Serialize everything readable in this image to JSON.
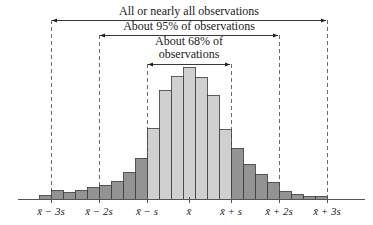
{
  "chart_data": {
    "type": "bar",
    "title": "",
    "xlabel": "",
    "ylabel": "",
    "bars": {
      "count": 24,
      "x_start": 39,
      "bar_width": 12,
      "baseline_y": 199,
      "tops_y": [
        195,
        190,
        192,
        190,
        187,
        185,
        181,
        172,
        158,
        128,
        90,
        76,
        67,
        77,
        95,
        129,
        148,
        164,
        174,
        182,
        191,
        194,
        196,
        196
      ],
      "shade": [
        "dark",
        "dark",
        "dark",
        "dark",
        "dark",
        "dark",
        "dark",
        "dark",
        "dark",
        "light",
        "light",
        "light",
        "light",
        "light",
        "light",
        "light",
        "dark",
        "dark",
        "dark",
        "dark",
        "dark",
        "dark",
        "dark",
        "dark"
      ]
    },
    "relative_heights": [
      4,
      9,
      7,
      9,
      12,
      14,
      18,
      27,
      41,
      71,
      109,
      123,
      132,
      122,
      104,
      70,
      51,
      35,
      25,
      17,
      8,
      5,
      3,
      3
    ],
    "ticks": [
      {
        "label": "x̄ − 3s",
        "x": 51
      },
      {
        "label": "x̄ − 2s",
        "x": 99
      },
      {
        "label": "x̄ − s",
        "x": 147
      },
      {
        "label": "x̄",
        "x": 189
      },
      {
        "label": "x̄ + s",
        "x": 231
      },
      {
        "label": "x̄ + 2s",
        "x": 279
      },
      {
        "label": "x̄ + 3s",
        "x": 327
      }
    ],
    "annotations": [
      {
        "lines": [
          "All or nearly all observations"
        ],
        "from_x": 51,
        "to_x": 327,
        "arrow_y": 20,
        "text_y": [
          15
        ]
      },
      {
        "lines": [
          "About 95% of observations"
        ],
        "from_x": 99,
        "to_x": 279,
        "arrow_y": 35,
        "text_y": [
          30
        ]
      },
      {
        "lines": [
          "About 68% of",
          "observations"
        ],
        "from_x": 147,
        "to_x": 231,
        "arrow_y": 64,
        "text_y": [
          45,
          58
        ]
      }
    ],
    "colors": {
      "dark": "#939393",
      "light": "#d0d0d0",
      "edge": "#3a3a3a",
      "axis": "#555555",
      "dash": "#444444"
    },
    "axis": {
      "x_from": 18,
      "x_to": 365,
      "y": 199
    }
  }
}
